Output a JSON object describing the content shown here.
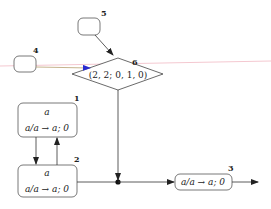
{
  "diagram": {
    "type": "state-transition",
    "nodes": [
      {
        "id": "1",
        "label": "1",
        "line1": "a",
        "line2": "a/a → a; 0",
        "shape": "rounded-rect"
      },
      {
        "id": "2",
        "label": "2",
        "line1": "a",
        "line2": "a/a → a; 0",
        "shape": "rounded-rect"
      },
      {
        "id": "3",
        "label": "3",
        "line1": "a/a → a; 0",
        "shape": "rounded-rect"
      },
      {
        "id": "4",
        "label": "4",
        "shape": "rounded-rect-empty"
      },
      {
        "id": "5",
        "label": "5",
        "shape": "rounded-rect-empty"
      },
      {
        "id": "6",
        "label": "6",
        "line1": "(2, 2; 0, 1, 0)",
        "shape": "diamond"
      }
    ],
    "edges": [
      {
        "from": "5",
        "to": "6"
      },
      {
        "from": "4",
        "to": "6",
        "color": "#2a2ad0"
      },
      {
        "from": "1",
        "to": "2"
      },
      {
        "from": "2",
        "to": "1"
      },
      {
        "from": "6",
        "to": "junction"
      },
      {
        "from": "2",
        "to": "junction"
      },
      {
        "from": "junction",
        "to": "3"
      },
      {
        "from": "3",
        "to": "output"
      }
    ],
    "colors": {
      "stroke": "#444444",
      "highlight_arrow": "#2a2ad0",
      "artifact_line": "#f4c8d0"
    }
  }
}
